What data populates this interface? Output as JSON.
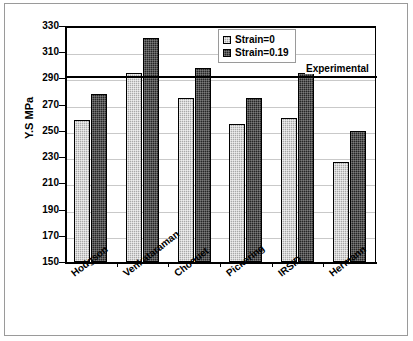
{
  "chart_data": {
    "type": "bar",
    "title": "",
    "xlabel": "",
    "ylabel": "Y.S MPa",
    "ylim": [
      150,
      330
    ],
    "ytick_step": 20,
    "yticks": [
      330,
      310,
      290,
      270,
      250,
      230,
      210,
      190,
      170,
      150
    ],
    "grid": true,
    "legend_position": "top-center-right",
    "categories": [
      "Hodgson",
      "Venkataraman",
      "Choquet",
      "Pickering",
      "IRSID",
      "Hermann"
    ],
    "series": [
      {
        "name": "Strain=0",
        "color": "#a8a8a8",
        "values": [
          258,
          294,
          275,
          255,
          260,
          226
        ]
      },
      {
        "name": "Strain=0.19",
        "color": "#262626",
        "values": [
          278,
          321,
          298,
          275,
          294,
          250
        ]
      }
    ],
    "annotations": [
      {
        "name": "experimental-line",
        "label": "Experimental",
        "type": "hline",
        "value": 291
      }
    ]
  },
  "legend": {
    "items": [
      {
        "label": "Strain=0"
      },
      {
        "label": "Strain=0.19"
      }
    ]
  },
  "axis": {
    "y_title": "Y.S MPa"
  },
  "annotation": {
    "experimental_label": "Experimental"
  }
}
